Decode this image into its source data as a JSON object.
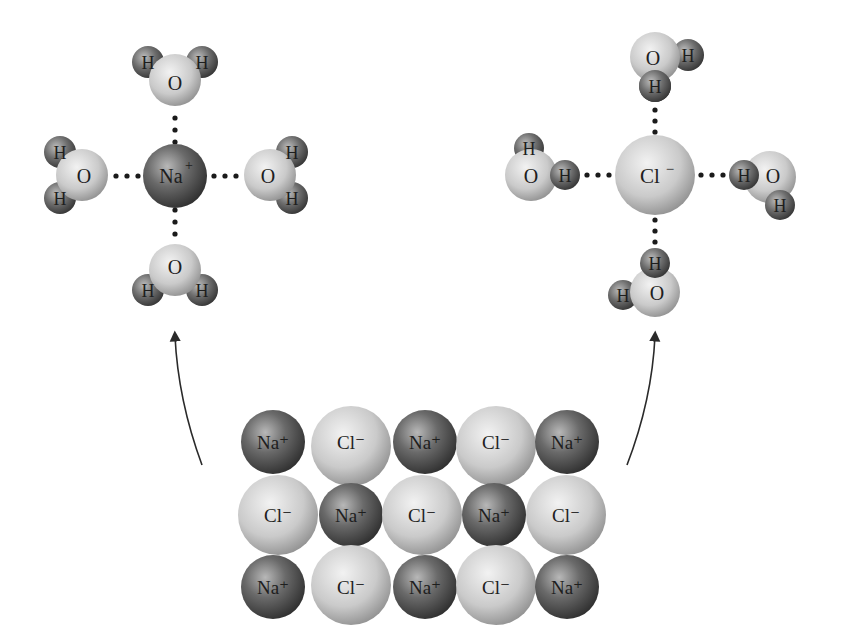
{
  "diagram": {
    "type": "dissolution-of-sodium-chloride",
    "colors": {
      "background": "#ffffff",
      "na_ion": "#5a5a5a",
      "cl_ion": "#c4c4c4",
      "oxygen": "#cdcdcd",
      "hydrogen": "#5e5e5e",
      "text": "#1e1e1e",
      "arrow": "#2a2a2a"
    },
    "labels": {
      "sodium": "Na",
      "sodium_charge": "+",
      "chloride": "Cl",
      "chloride_charge": "−",
      "oxygen": "O",
      "hydrogen": "H"
    },
    "hydrated_sodium": {
      "center_label": "Na⁺",
      "waters": [
        {
          "position": "top",
          "atoms": [
            "H",
            "O",
            "H"
          ]
        },
        {
          "position": "left",
          "atoms": [
            "H",
            "O",
            "H"
          ]
        },
        {
          "position": "right",
          "atoms": [
            "H",
            "O",
            "H"
          ]
        },
        {
          "position": "bottom",
          "atoms": [
            "H",
            "O",
            "H"
          ]
        }
      ],
      "note": "Oxygen (partial negative) of water oriented toward Na⁺"
    },
    "hydrated_chloride": {
      "center_label": "Cl⁻",
      "waters": [
        {
          "position": "top",
          "atoms": [
            "O",
            "H",
            "H"
          ]
        },
        {
          "position": "left",
          "atoms": [
            "H",
            "O",
            "H"
          ]
        },
        {
          "position": "right",
          "atoms": [
            "H",
            "O",
            "H"
          ]
        },
        {
          "position": "bottom",
          "atoms": [
            "H",
            "H",
            "O"
          ]
        }
      ],
      "note": "Hydrogen (partial positive) of water oriented toward Cl⁻"
    },
    "crystal_lattice": {
      "rows": [
        [
          "Na⁺",
          "Cl⁻",
          "Na⁺",
          "Cl⁻",
          "Na⁺"
        ],
        [
          "Cl⁻",
          "Na⁺",
          "Cl⁻",
          "Na⁺",
          "Cl⁻"
        ],
        [
          "Na⁺",
          "Cl⁻",
          "Na⁺",
          "Cl⁻",
          "Na⁺"
        ]
      ]
    },
    "arrows": [
      {
        "from": "crystal_lattice",
        "to": "hydrated_sodium"
      },
      {
        "from": "crystal_lattice",
        "to": "hydrated_chloride"
      }
    ]
  }
}
